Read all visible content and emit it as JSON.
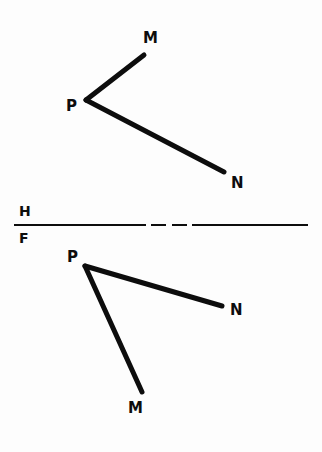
{
  "figure": {
    "kind": "descriptive-geometry-orthographic-projection",
    "background_color": "#fdfdfd",
    "stroke_color": "#0d0d0d",
    "canvas": {
      "width": 322,
      "height": 452
    }
  },
  "fold_line": {
    "above_label": "H",
    "below_label": "F",
    "above_label_position": {
      "x": 19,
      "y": 204
    },
    "below_label_position": {
      "x": 19,
      "y": 231
    },
    "y": 225,
    "x_start": 14,
    "x_end": 308,
    "stroke_width": 2,
    "segments": [
      {
        "type": "solid",
        "x1": 14,
        "x2": 146
      },
      {
        "type": "dash",
        "x1": 151,
        "x2": 166
      },
      {
        "type": "dash",
        "x1": 172,
        "x2": 187
      },
      {
        "type": "solid",
        "x1": 192,
        "x2": 308
      }
    ]
  },
  "top_view": {
    "name": "horizontal-projection",
    "stroke_width": 5,
    "points": {
      "P": {
        "x": 86,
        "y": 100
      },
      "M": {
        "x": 144,
        "y": 55
      },
      "N": {
        "x": 224,
        "y": 172
      }
    },
    "edges": [
      {
        "from": "P",
        "to": "M"
      },
      {
        "from": "P",
        "to": "N"
      }
    ],
    "labels": [
      {
        "text": "P",
        "x": 66,
        "y": 99
      },
      {
        "text": "M",
        "x": 143,
        "y": 31
      },
      {
        "text": "N",
        "x": 231,
        "y": 176
      }
    ]
  },
  "front_view": {
    "name": "frontal-projection",
    "stroke_width": 5,
    "points": {
      "P": {
        "x": 85,
        "y": 266
      },
      "M": {
        "x": 142,
        "y": 392
      },
      "N": {
        "x": 222,
        "y": 306
      }
    },
    "edges": [
      {
        "from": "P",
        "to": "M"
      },
      {
        "from": "P",
        "to": "N"
      }
    ],
    "labels": [
      {
        "text": "P",
        "x": 67,
        "y": 250
      },
      {
        "text": "M",
        "x": 128,
        "y": 401
      },
      {
        "text": "N",
        "x": 230,
        "y": 303
      }
    ]
  }
}
